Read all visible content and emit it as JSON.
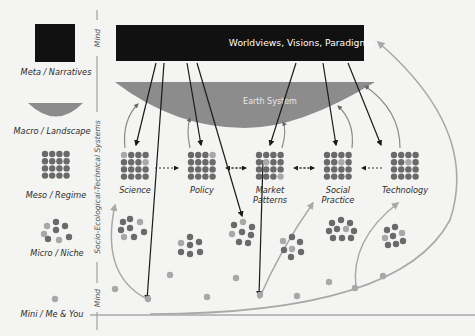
{
  "diagram": {
    "title_box": "Worldviews, Visions, Paradigms",
    "earth_system": "Earth System",
    "levels": [
      {
        "id": "meta",
        "label": "Meta / Narratives"
      },
      {
        "id": "macro",
        "label": "Macro / Landscape"
      },
      {
        "id": "meso",
        "label": "Meso / Regime"
      },
      {
        "id": "micro",
        "label": "Micro / Niche"
      },
      {
        "id": "mini",
        "label": "Mini / Me & You"
      }
    ],
    "axis": {
      "top": "Mind",
      "middle": "Socio-Ecological-Technical Systems",
      "bottom": "Mind"
    },
    "regimes": [
      {
        "line1": "Science",
        "line2": ""
      },
      {
        "line1": "Policy",
        "line2": ""
      },
      {
        "line1": "Market",
        "line2": "Patterns"
      },
      {
        "line1": "Social",
        "line2": "Practice"
      },
      {
        "line1": "Technology",
        "line2": ""
      }
    ],
    "colors": {
      "box": "#111111",
      "earth": "#8c8c8c",
      "dot_dark": "#6a6a6a",
      "dot_light": "#a8a8a8",
      "arrow_dark": "#1a1a1a",
      "arrow_light": "#a9a9a9",
      "background": "#f4f4f2"
    }
  }
}
